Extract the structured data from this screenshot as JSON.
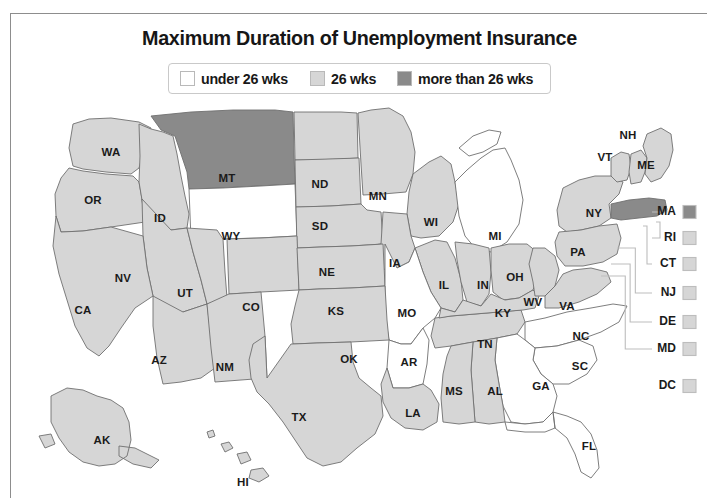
{
  "title": "Maximum Duration of Unemployment Insurance",
  "colors": {
    "under26": "#ffffff",
    "weeks26": "#d6d6d6",
    "over26": "#8a8a8a",
    "border": "#6f6f6f",
    "leader": "#bdbdbd",
    "text": "#1a1a1a",
    "frame": "#8d8d8d"
  },
  "legend": {
    "items": [
      {
        "label": "under 26 wks",
        "key": "under26",
        "swatch": "#ffffff"
      },
      {
        "label": "26 wks",
        "key": "weeks26",
        "swatch": "#d6d6d6"
      },
      {
        "label": "more than 26 wks",
        "key": "over26",
        "swatch": "#8a8a8a"
      }
    ]
  },
  "chart_data": {
    "type": "map",
    "title": "Maximum Duration of Unemployment Insurance",
    "legend_position": "top-center",
    "categories": [
      "under 26 wks",
      "26 wks",
      "more than 26 wks"
    ],
    "category_colors": [
      "#ffffff",
      "#d6d6d6",
      "#8a8a8a"
    ],
    "regions": [
      {
        "code": "WA",
        "category": "26 wks"
      },
      {
        "code": "OR",
        "category": "26 wks"
      },
      {
        "code": "ID",
        "category": "26 wks"
      },
      {
        "code": "MT",
        "category": "more than 26 wks"
      },
      {
        "code": "WY",
        "category": "under 26 wks"
      },
      {
        "code": "ND",
        "category": "26 wks"
      },
      {
        "code": "SD",
        "category": "26 wks"
      },
      {
        "code": "MN",
        "category": "26 wks"
      },
      {
        "code": "WI",
        "category": "26 wks"
      },
      {
        "code": "MI",
        "category": "under 26 wks"
      },
      {
        "code": "NV",
        "category": "26 wks"
      },
      {
        "code": "UT",
        "category": "26 wks"
      },
      {
        "code": "CO",
        "category": "26 wks"
      },
      {
        "code": "NE",
        "category": "26 wks"
      },
      {
        "code": "IA",
        "category": "26 wks"
      },
      {
        "code": "IL",
        "category": "26 wks"
      },
      {
        "code": "IN",
        "category": "26 wks"
      },
      {
        "code": "OH",
        "category": "26 wks"
      },
      {
        "code": "CA",
        "category": "26 wks"
      },
      {
        "code": "AZ",
        "category": "26 wks"
      },
      {
        "code": "NM",
        "category": "26 wks"
      },
      {
        "code": "KS",
        "category": "26 wks"
      },
      {
        "code": "MO",
        "category": "under 26 wks"
      },
      {
        "code": "KY",
        "category": "26 wks"
      },
      {
        "code": "WV",
        "category": "26 wks"
      },
      {
        "code": "VA",
        "category": "26 wks"
      },
      {
        "code": "OK",
        "category": "26 wks"
      },
      {
        "code": "AR",
        "category": "under 26 wks"
      },
      {
        "code": "TN",
        "category": "26 wks"
      },
      {
        "code": "NC",
        "category": "under 26 wks"
      },
      {
        "code": "SC",
        "category": "under 26 wks"
      },
      {
        "code": "GA",
        "category": "under 26 wks"
      },
      {
        "code": "TX",
        "category": "26 wks"
      },
      {
        "code": "LA",
        "category": "26 wks"
      },
      {
        "code": "MS",
        "category": "26 wks"
      },
      {
        "code": "AL",
        "category": "26 wks"
      },
      {
        "code": "FL",
        "category": "under 26 wks"
      },
      {
        "code": "NY",
        "category": "26 wks"
      },
      {
        "code": "PA",
        "category": "26 wks"
      },
      {
        "code": "VT",
        "category": "26 wks"
      },
      {
        "code": "NH",
        "category": "26 wks"
      },
      {
        "code": "ME",
        "category": "26 wks"
      },
      {
        "code": "MA",
        "category": "more than 26 wks"
      },
      {
        "code": "RI",
        "category": "26 wks"
      },
      {
        "code": "CT",
        "category": "26 wks"
      },
      {
        "code": "NJ",
        "category": "26 wks"
      },
      {
        "code": "DE",
        "category": "26 wks"
      },
      {
        "code": "MD",
        "category": "26 wks"
      },
      {
        "code": "DC",
        "category": "26 wks"
      },
      {
        "code": "AK",
        "category": "26 wks"
      },
      {
        "code": "HI",
        "category": "26 wks"
      }
    ]
  },
  "map": {
    "labels": [
      {
        "code": "WA",
        "x": 100,
        "y": 57
      },
      {
        "code": "OR",
        "x": 82,
        "y": 105
      },
      {
        "code": "ID",
        "x": 149,
        "y": 123
      },
      {
        "code": "MT",
        "x": 216,
        "y": 83
      },
      {
        "code": "WY",
        "x": 220,
        "y": 141
      },
      {
        "code": "ND",
        "x": 309,
        "y": 89
      },
      {
        "code": "SD",
        "x": 309,
        "y": 131
      },
      {
        "code": "MN",
        "x": 367,
        "y": 101
      },
      {
        "code": "WI",
        "x": 420,
        "y": 127
      },
      {
        "code": "MI",
        "x": 484,
        "y": 141
      },
      {
        "code": "NV",
        "x": 112,
        "y": 183
      },
      {
        "code": "UT",
        "x": 174,
        "y": 198
      },
      {
        "code": "CO",
        "x": 240,
        "y": 212
      },
      {
        "code": "NE",
        "x": 316,
        "y": 177
      },
      {
        "code": "IA",
        "x": 384,
        "y": 168
      },
      {
        "code": "IL",
        "x": 433,
        "y": 190
      },
      {
        "code": "IN",
        "x": 472,
        "y": 190
      },
      {
        "code": "OH",
        "x": 504,
        "y": 182
      },
      {
        "code": "CA",
        "x": 72,
        "y": 215
      },
      {
        "code": "AZ",
        "x": 148,
        "y": 265
      },
      {
        "code": "NM",
        "x": 214,
        "y": 272
      },
      {
        "code": "KS",
        "x": 325,
        "y": 216
      },
      {
        "code": "MO",
        "x": 396,
        "y": 218
      },
      {
        "code": "KY",
        "x": 492,
        "y": 218
      },
      {
        "code": "WV",
        "x": 522,
        "y": 207
      },
      {
        "code": "VA",
        "x": 556,
        "y": 211
      },
      {
        "code": "OK",
        "x": 338,
        "y": 264
      },
      {
        "code": "AR",
        "x": 398,
        "y": 267
      },
      {
        "code": "TN",
        "x": 474,
        "y": 249
      },
      {
        "code": "NC",
        "x": 570,
        "y": 241
      },
      {
        "code": "SC",
        "x": 569,
        "y": 271
      },
      {
        "code": "GA",
        "x": 530,
        "y": 291
      },
      {
        "code": "TX",
        "x": 288,
        "y": 322
      },
      {
        "code": "LA",
        "x": 402,
        "y": 318
      },
      {
        "code": "MS",
        "x": 443,
        "y": 296
      },
      {
        "code": "AL",
        "x": 484,
        "y": 296
      },
      {
        "code": "FL",
        "x": 578,
        "y": 351
      },
      {
        "code": "NY",
        "x": 583,
        "y": 118
      },
      {
        "code": "PA",
        "x": 567,
        "y": 157
      },
      {
        "code": "VT",
        "x": 594,
        "y": 62
      },
      {
        "code": "NH",
        "x": 617,
        "y": 40
      },
      {
        "code": "ME",
        "x": 635,
        "y": 70
      },
      {
        "code": "AK",
        "x": 91,
        "y": 345
      },
      {
        "code": "HI",
        "x": 232,
        "y": 387
      }
    ],
    "callouts": [
      {
        "code": "MA",
        "key": "over26",
        "swatch": "#8a8a8a",
        "y": 116
      },
      {
        "code": "RI",
        "key": "weeks26",
        "swatch": "#d6d6d6",
        "y": 142
      },
      {
        "code": "CT",
        "key": "weeks26",
        "swatch": "#d6d6d6",
        "y": 168
      },
      {
        "code": "NJ",
        "key": "weeks26",
        "swatch": "#d6d6d6",
        "y": 197
      },
      {
        "code": "DE",
        "key": "weeks26",
        "swatch": "#d6d6d6",
        "y": 226
      },
      {
        "code": "MD",
        "key": "weeks26",
        "swatch": "#d6d6d6",
        "y": 253
      },
      {
        "code": "DC",
        "key": "weeks26",
        "swatch": "#d6d6d6",
        "y": 290
      }
    ]
  }
}
